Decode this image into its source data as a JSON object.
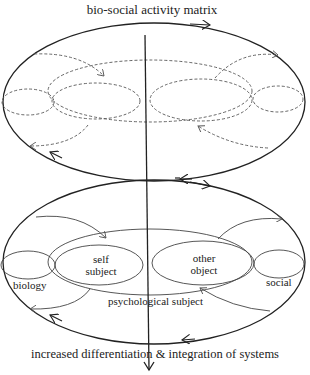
{
  "title": "bio-social activity matrix",
  "footer": "increased differentiation & integration of systems",
  "lower_labels": {
    "self_line1": "self",
    "self_line2": "subject",
    "other_line1": "other",
    "other_line2": "object",
    "biology": "biology",
    "social": "social",
    "psychological": "psychological subject"
  },
  "colors": {
    "stroke": "#222222",
    "background": "#ffffff"
  }
}
